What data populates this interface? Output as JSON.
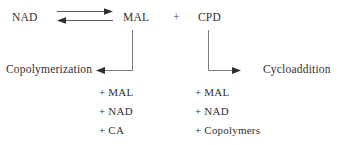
{
  "diagram": {
    "type": "reaction-scheme",
    "reactants": {
      "nad": "NAD",
      "mal": "MAL",
      "plus": "+",
      "cpd": "CPD"
    },
    "equilibrium": {
      "forward_label": "",
      "reverse_label": ""
    },
    "branches": {
      "left": {
        "label": "Copolymerization",
        "products": [
          "+ MAL",
          "+ NAD",
          "+ CA"
        ]
      },
      "right": {
        "label": "Cycloaddition",
        "products": [
          "+ MAL",
          "+ NAD",
          "+ Copolymers"
        ]
      }
    },
    "colors": {
      "background": "#ffffff",
      "text": "#33302f",
      "line": "#5a5a5a",
      "arrowhead": "#2e2e2e"
    }
  }
}
